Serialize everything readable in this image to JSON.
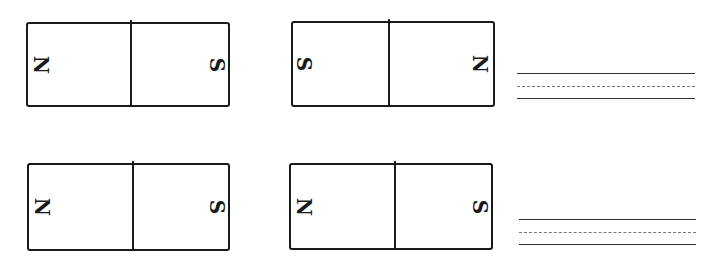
{
  "worksheet": {
    "magnets": [
      {
        "left_pole": "N",
        "right_pole": "S"
      },
      {
        "left_pole": "S",
        "right_pole": "N"
      },
      {
        "left_pole": "N",
        "right_pole": "S"
      },
      {
        "left_pole": "N",
        "right_pole": "S"
      }
    ],
    "answer_lines": [
      {
        "value": ""
      },
      {
        "value": ""
      }
    ]
  }
}
